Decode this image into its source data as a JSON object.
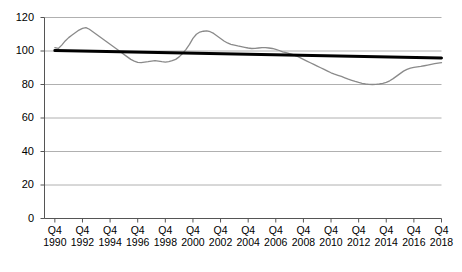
{
  "chart_data": {
    "type": "line",
    "title": "",
    "subtitle": "",
    "xlabel": "",
    "ylabel": "",
    "xlim": [
      1990,
      2018.75
    ],
    "ylim": [
      0,
      120
    ],
    "grid": true,
    "legend_position": "none",
    "y_ticks": [
      0,
      20,
      40,
      60,
      80,
      100,
      120
    ],
    "x_tick_quarter_label": "Q4",
    "x_tick_years": [
      1990,
      1992,
      1994,
      1996,
      1998,
      2000,
      2002,
      2004,
      2006,
      2008,
      2010,
      2012,
      2014,
      2016,
      2018
    ],
    "colors": {
      "series_line": "#8a8a8a",
      "trend_line": "#000000",
      "grid": "#b0b0b0",
      "axis": "#555555",
      "background": "#ffffff"
    },
    "series": [
      {
        "name": "Index",
        "style": "line",
        "color": "#8a8a8a",
        "width": 1.3,
        "x": [
          1990.75,
          1991.0,
          1991.25,
          1991.5,
          1991.75,
          1992.0,
          1992.25,
          1992.5,
          1992.75,
          1993.0,
          1993.25,
          1993.5,
          1993.75,
          1994.0,
          1994.25,
          1994.5,
          1994.75,
          1995.0,
          1995.25,
          1995.5,
          1995.75,
          1996.0,
          1996.25,
          1996.5,
          1996.75,
          1997.0,
          1997.25,
          1997.5,
          1997.75,
          1998.0,
          1998.25,
          1998.5,
          1998.75,
          1999.0,
          1999.25,
          1999.5,
          1999.75,
          2000.0,
          2000.25,
          2000.5,
          2000.75,
          2001.0,
          2001.25,
          2001.5,
          2001.75,
          2002.0,
          2002.25,
          2002.5,
          2002.75,
          2003.0,
          2003.25,
          2003.5,
          2003.75,
          2004.0,
          2004.25,
          2004.5,
          2004.75,
          2005.0,
          2005.25,
          2005.5,
          2005.75,
          2006.0,
          2006.25,
          2006.5,
          2006.75,
          2007.0,
          2007.25,
          2007.5,
          2007.75,
          2008.0,
          2008.25,
          2008.5,
          2008.75,
          2009.0,
          2009.25,
          2009.5,
          2009.75,
          2010.0,
          2010.25,
          2010.5,
          2010.75,
          2011.0,
          2011.25,
          2011.5,
          2011.75,
          2012.0,
          2012.25,
          2012.5,
          2012.75,
          2013.0,
          2013.25,
          2013.5,
          2013.75,
          2014.0,
          2014.25,
          2014.5,
          2014.75,
          2015.0,
          2015.25,
          2015.5,
          2015.75,
          2016.0,
          2016.25,
          2016.5,
          2016.75,
          2017.0,
          2017.25,
          2017.5,
          2017.75,
          2018.0,
          2018.25,
          2018.5,
          2018.75
        ],
        "values": [
          102.0,
          101.5,
          103.5,
          106.0,
          108.0,
          109.5,
          111.0,
          112.5,
          113.5,
          114.0,
          113.0,
          111.5,
          110.0,
          108.5,
          107.0,
          105.5,
          104.0,
          102.5,
          101.0,
          99.5,
          98.0,
          96.5,
          95.0,
          94.0,
          93.2,
          93.0,
          93.3,
          93.6,
          94.0,
          94.3,
          94.0,
          93.6,
          93.3,
          93.6,
          94.2,
          95.0,
          96.5,
          98.5,
          101.0,
          104.0,
          107.5,
          110.0,
          111.3,
          111.8,
          112.0,
          111.5,
          110.5,
          109.0,
          107.5,
          106.0,
          104.8,
          104.0,
          103.5,
          103.0,
          102.6,
          102.2,
          101.8,
          101.5,
          101.6,
          101.8,
          102.0,
          102.0,
          101.8,
          101.5,
          101.0,
          100.3,
          99.5,
          99.0,
          98.5,
          97.8,
          97.0,
          96.0,
          95.0,
          94.0,
          93.0,
          92.0,
          91.0,
          90.0,
          89.0,
          88.0,
          87.0,
          86.2,
          85.5,
          84.8,
          84.0,
          83.2,
          82.5,
          81.8,
          81.2,
          80.7,
          80.3,
          80.1,
          80.0,
          80.1,
          80.3,
          80.7,
          81.3,
          82.2,
          83.5,
          85.0,
          86.5,
          88.0,
          89.0,
          89.8,
          90.2,
          90.5,
          90.8,
          91.2,
          91.6,
          92.0,
          92.4,
          92.8,
          93.0
        ]
      },
      {
        "name": "Trend",
        "style": "trendline",
        "color": "#000000",
        "width": 3.0,
        "x": [
          1990.75,
          2018.75
        ],
        "values": [
          100.3,
          95.8
        ]
      }
    ]
  }
}
